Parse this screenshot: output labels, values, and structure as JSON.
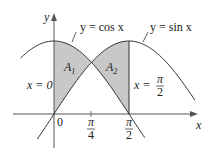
{
  "chart_data": {
    "type": "line",
    "title": "",
    "xlabel": "x",
    "ylabel": "y",
    "series": [
      {
        "name": "y = cos x",
        "function": "cos",
        "x_range": [
          -0.7,
          1.9
        ]
      },
      {
        "name": "y = sin x",
        "function": "sin",
        "x_range": [
          -0.35,
          2.95
        ]
      }
    ],
    "shaded_regions": [
      {
        "name": "A1",
        "from": 0,
        "to": 0.7854,
        "between": [
          "cos x",
          "sin x"
        ]
      },
      {
        "name": "A2",
        "from": 0.7854,
        "to": 1.5708,
        "between": [
          "sin x",
          "cos x"
        ]
      }
    ],
    "vertical_lines": [
      "x = 0",
      "x = π/2"
    ],
    "x_ticks": [
      "0",
      "π/4",
      "π/2"
    ],
    "grid": false
  },
  "labels": {
    "y_axis": "y",
    "x_axis": "x",
    "cos_curve": "y = cos x",
    "sin_curve": "y = sin x",
    "region1": "A",
    "region1_sub": "1",
    "region2": "A",
    "region2_sub": "2",
    "line_left": "x = 0",
    "line_right_prefix": "x =",
    "pi": "π",
    "two": "2",
    "four": "4",
    "zero": "0"
  },
  "colors": {
    "shade": "#c8c8c8",
    "curve": "#333333",
    "axis": "#555555"
  }
}
